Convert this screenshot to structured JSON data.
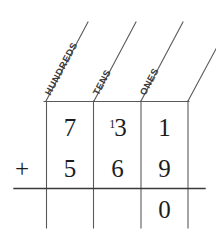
{
  "worksheet": {
    "type": "place-value-column-addition",
    "background_color": "#ffffff",
    "ink_color": "#1c1c1c",
    "rule_color": "#5a5a5a"
  },
  "headers": [
    {
      "label": "HUNDREDS",
      "column": "hundreds"
    },
    {
      "label": "TENS",
      "column": "tens"
    },
    {
      "label": "ONES",
      "column": "ones"
    }
  ],
  "operator": {
    "symbol": "+",
    "name": "plus-sign"
  },
  "rows": {
    "addend_one": {
      "hundreds": "7",
      "tens": "3",
      "tens_carry": "1",
      "ones": "1"
    },
    "addend_two": {
      "hundreds": "5",
      "tens": "6",
      "ones": "9"
    },
    "sum": {
      "hundreds": "",
      "tens": "",
      "ones": "0"
    }
  }
}
